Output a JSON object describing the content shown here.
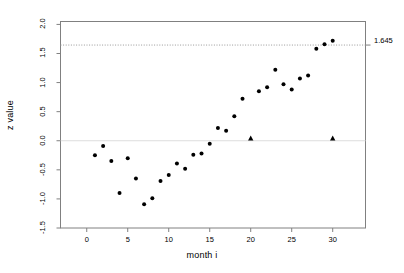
{
  "chart_data": {
    "type": "scatter",
    "title": "",
    "xlabel": "month i",
    "ylabel": "z value",
    "xlim": [
      -3.2,
      34.0
    ],
    "ylim": [
      -1.5,
      2.05
    ],
    "xticks": [
      0,
      5,
      10,
      15,
      20,
      25,
      30
    ],
    "xtick_labels": [
      "0",
      "5",
      "10",
      "15",
      "20",
      "25",
      "30"
    ],
    "yticks": [
      -1.5,
      -1.0,
      -0.5,
      0.0,
      0.5,
      1.0,
      1.5,
      2.0
    ],
    "ytick_labels": [
      "-1.5",
      "-1.0",
      "-0.5",
      "0.0",
      "0.5",
      "1.0",
      "1.5",
      "2.0"
    ],
    "grid": false,
    "legend": null,
    "annotations": [
      {
        "name": "threshold-line",
        "type": "hline",
        "y": 1.645,
        "label": "1.645",
        "style": "dotted",
        "color": "#999999"
      },
      {
        "name": "zero-line",
        "type": "hline",
        "y": 0.0,
        "label": "",
        "style": "solid",
        "color": "#dddddd"
      }
    ],
    "series": [
      {
        "name": "z statistic",
        "marker": "circle",
        "color": "#000000",
        "x": [
          1,
          2,
          3,
          4,
          5,
          6,
          7,
          8,
          9,
          10,
          11,
          12,
          13,
          14,
          15,
          16,
          17,
          18,
          19,
          21,
          22,
          23,
          24,
          25,
          26,
          27,
          28,
          29,
          30
        ],
        "y": [
          -0.25,
          -0.09,
          -0.35,
          -0.9,
          -0.3,
          -0.65,
          -1.09,
          -0.99,
          -0.69,
          -0.59,
          -0.39,
          -0.48,
          -0.24,
          -0.22,
          -0.05,
          0.22,
          0.17,
          0.42,
          0.72,
          0.85,
          0.92,
          1.22,
          0.97,
          0.88,
          1.07,
          1.12,
          1.58,
          1.66,
          1.72
        ]
      },
      {
        "name": "boundary crossing",
        "marker": "triangle",
        "color": "#000000",
        "x": [
          20,
          30
        ],
        "y": [
          0.04,
          0.04
        ]
      }
    ]
  }
}
